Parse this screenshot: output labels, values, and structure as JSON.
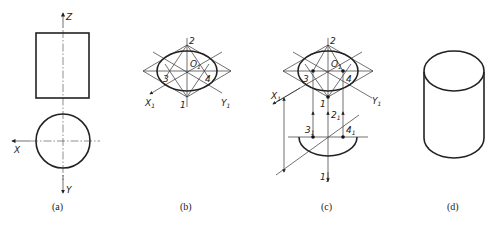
{
  "figure": {
    "panels": [
      {
        "id": "a",
        "caption": "(a)",
        "axis_labels": {
          "z": "Z",
          "x": "X",
          "y": "Y"
        }
      },
      {
        "id": "b",
        "caption": "(b)",
        "axis_labels": {
          "x1": "X",
          "y1": "Y",
          "sub": "1"
        },
        "points": [
          "1",
          "2",
          "3",
          "4"
        ],
        "center_label": "O",
        "center_sub": "1"
      },
      {
        "id": "c",
        "caption": "(c)",
        "axis_labels": {
          "x1": "X",
          "y1": "Y",
          "sub": "1"
        },
        "points": [
          "1",
          "2",
          "3",
          "4"
        ],
        "center_label": "O",
        "center_sub": "1",
        "projected_points": [
          {
            "label": "2",
            "sub": "1"
          },
          {
            "label": "3",
            "sub": "1"
          },
          {
            "label": "4",
            "sub": "1"
          },
          {
            "label": "1",
            "sub": "1"
          }
        ]
      },
      {
        "id": "d",
        "caption": "(d)"
      }
    ]
  }
}
